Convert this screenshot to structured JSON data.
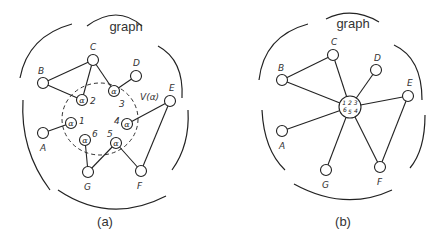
{
  "panels": [
    {
      "id": "a",
      "title": "graph",
      "caption": "(a)",
      "nodes": [
        {
          "id": "A",
          "label": "A"
        },
        {
          "id": "B",
          "label": "B"
        },
        {
          "id": "C",
          "label": "C"
        },
        {
          "id": "D",
          "label": "D"
        },
        {
          "id": "E",
          "label": "E"
        },
        {
          "id": "F",
          "label": "F"
        },
        {
          "id": "G",
          "label": "G"
        }
      ],
      "alpha_nodes": [
        {
          "id": "1",
          "symbol": "α",
          "number": "1"
        },
        {
          "id": "2",
          "symbol": "α",
          "number": "2"
        },
        {
          "id": "3",
          "symbol": "α",
          "number": "3"
        },
        {
          "id": "4",
          "symbol": "α",
          "number": "4"
        },
        {
          "id": "5",
          "symbol": "α",
          "number": "5"
        },
        {
          "id": "6",
          "symbol": "α",
          "number": "6"
        }
      ],
      "region_label": "V(α)",
      "edges": [
        [
          "B",
          "C"
        ],
        [
          "B",
          "α2"
        ],
        [
          "C",
          "α2"
        ],
        [
          "C",
          "α3"
        ],
        [
          "α3",
          "D"
        ],
        [
          "A",
          "α1"
        ],
        [
          "α4",
          "E"
        ],
        [
          "E",
          "F"
        ],
        [
          "α6",
          "G"
        ],
        [
          "G",
          "α5"
        ],
        [
          "α5",
          "F"
        ]
      ]
    },
    {
      "id": "b",
      "title": "graph",
      "caption": "(b)",
      "nodes": [
        {
          "id": "A",
          "label": "A"
        },
        {
          "id": "B",
          "label": "B"
        },
        {
          "id": "C",
          "label": "C"
        },
        {
          "id": "D",
          "label": "D"
        },
        {
          "id": "E",
          "label": "E"
        },
        {
          "id": "F",
          "label": "F"
        },
        {
          "id": "G",
          "label": "G"
        }
      ],
      "supernode": {
        "top": "1 2 3",
        "bottom_left": "6",
        "bottom_mid": "5",
        "bottom_right": "4"
      },
      "edges": [
        [
          "B",
          "C"
        ],
        [
          "B",
          "S"
        ],
        [
          "C",
          "S"
        ],
        [
          "D",
          "S"
        ],
        [
          "E",
          "S"
        ],
        [
          "A",
          "S"
        ],
        [
          "G",
          "S"
        ],
        [
          "F",
          "S"
        ],
        [
          "E",
          "F"
        ]
      ]
    }
  ]
}
